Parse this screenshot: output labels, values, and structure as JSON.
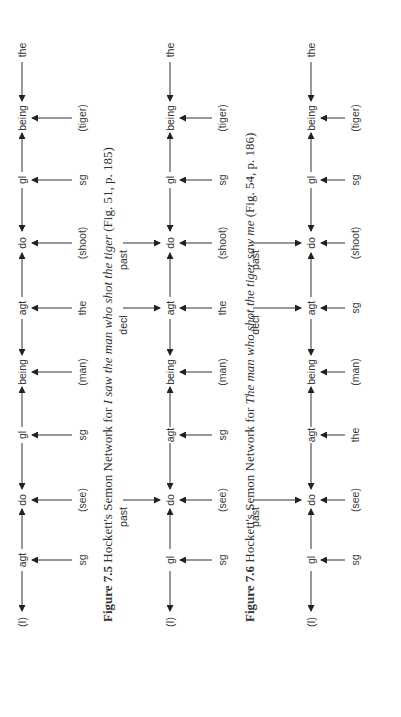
{
  "figures": [
    {
      "id": "fig-7-5",
      "caption": {
        "number": "Figure 7.5",
        "prefix": "Hockett's Semon Network for",
        "sentence": "I saw the man who shot the tiger",
        "source": "(Fig. 51, p. 185)"
      },
      "spine": [
        "(I)",
        "agt",
        "do",
        "gl",
        "being",
        "agt",
        "do",
        "gl",
        "being",
        "the"
      ],
      "below_labels": [
        {
          "node_index": 1,
          "text": "sg"
        },
        {
          "node_index": 2,
          "text": "(see)"
        },
        {
          "node_index": 3,
          "text": "sg"
        },
        {
          "node_index": 4,
          "text": "(man)"
        },
        {
          "node_index": 5,
          "text": "the"
        },
        {
          "node_index": 6,
          "text": "(shoot)"
        },
        {
          "node_index": 7,
          "text": "sg"
        },
        {
          "node_index": 8,
          "text": "(tiger)"
        }
      ],
      "modifiers": [
        {
          "node_index": 2,
          "text": "past"
        },
        {
          "node_index": 5,
          "text": "decl"
        },
        {
          "node_index": 6,
          "text": "past"
        }
      ]
    },
    {
      "id": "fig-7-6",
      "caption": {
        "number": "Figure 7.6",
        "prefix": "Hockett's Semon Network for",
        "sentence": "The man who shot the tiger saw me",
        "source": "(Fig. 54, p. 186)"
      },
      "spine": [
        "(I)",
        "gl",
        "do",
        "agt",
        "being",
        "agt",
        "do",
        "gl",
        "being",
        "the"
      ],
      "below_labels": [
        {
          "node_index": 1,
          "text": "sg"
        },
        {
          "node_index": 2,
          "text": "(see)"
        },
        {
          "node_index": 3,
          "text": "sg"
        },
        {
          "node_index": 4,
          "text": "(man)"
        },
        {
          "node_index": 5,
          "text": "the"
        },
        {
          "node_index": 6,
          "text": "(shoot)"
        },
        {
          "node_index": 7,
          "text": "sg"
        },
        {
          "node_index": 8,
          "text": "(tiger)"
        }
      ],
      "modifiers": [
        {
          "node_index": 2,
          "text": "past"
        },
        {
          "node_index": 5,
          "text": "decl"
        },
        {
          "node_index": 6,
          "text": "past"
        }
      ]
    },
    {
      "id": "fig-7-7",
      "caption": {
        "number": "",
        "prefix": "",
        "sentence": "",
        "source": ""
      },
      "spine": [
        "(I)",
        "gl",
        "do",
        "agt",
        "being",
        "agt",
        "do",
        "gl",
        "being",
        "the"
      ],
      "below_labels": [
        {
          "node_index": 1,
          "text": "sg"
        },
        {
          "node_index": 2,
          "text": "(see)"
        },
        {
          "node_index": 3,
          "text": "the"
        },
        {
          "node_index": 4,
          "text": "(man)"
        },
        {
          "node_index": 5,
          "text": "sg"
        },
        {
          "node_index": 6,
          "text": "(shoot)"
        },
        {
          "node_index": 7,
          "text": "sg"
        },
        {
          "node_index": 8,
          "text": "(tiger)"
        }
      ],
      "modifiers": []
    }
  ]
}
